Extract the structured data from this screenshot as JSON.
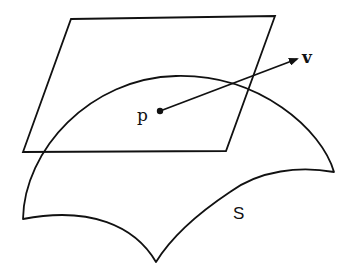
{
  "diagram": {
    "type": "tangent-plane-illustration",
    "stroke_color": "#111111",
    "background": "#ffffff",
    "labels": {
      "point": "p",
      "vector": "v",
      "surface": "S"
    },
    "elements": [
      {
        "name": "tangent-plane",
        "shape": "parallelogram"
      },
      {
        "name": "surface",
        "shape": "curved-patch",
        "label": "S"
      },
      {
        "name": "point",
        "shape": "dot",
        "label": "p"
      },
      {
        "name": "tangent-vector",
        "shape": "arrow",
        "from": "p",
        "label": "v"
      }
    ]
  }
}
